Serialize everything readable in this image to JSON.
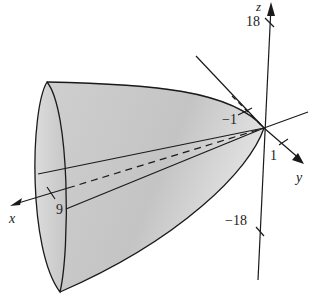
{
  "figure": {
    "surface_fill": "#c8c8c8",
    "rim_fill": "#d8d8d8",
    "line_color": "#1a1a1a"
  },
  "axes": {
    "x": {
      "label": "x",
      "tick_label": "9"
    },
    "y": {
      "label": "y",
      "tick_label": "1"
    },
    "z": {
      "label": "z",
      "tick_top": "18",
      "tick_bottom": "−18"
    },
    "neg_y_tick": "−1"
  }
}
